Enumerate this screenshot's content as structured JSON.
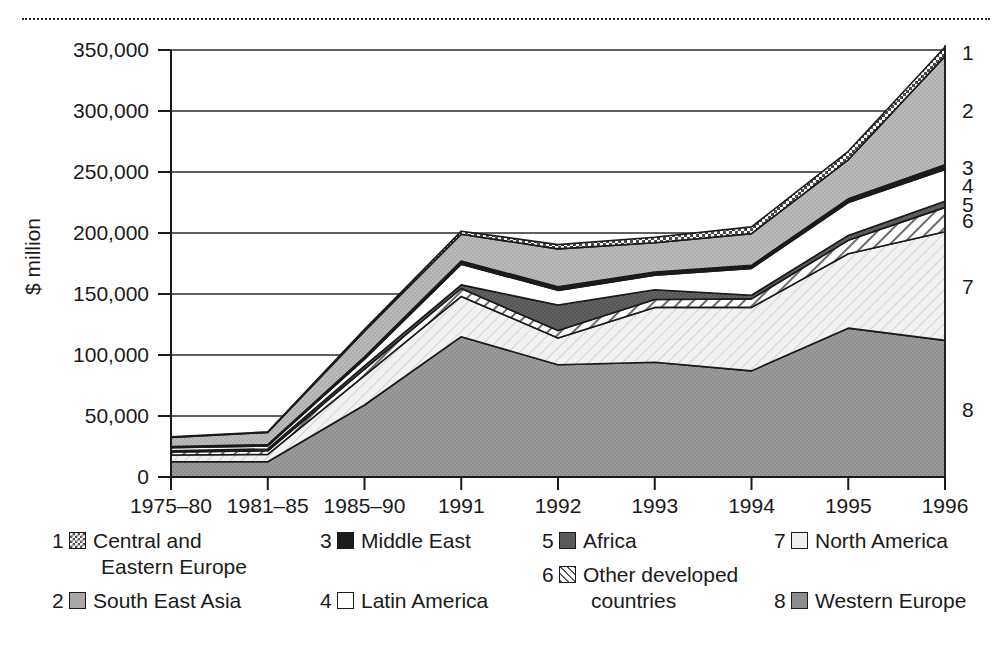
{
  "chart_data": {
    "type": "area",
    "stacked": true,
    "title": "",
    "xlabel": "",
    "ylabel": "$ million",
    "ylim": [
      0,
      350000
    ],
    "yticks": [
      0,
      50000,
      100000,
      150000,
      200000,
      250000,
      300000,
      350000
    ],
    "ytick_labels": [
      "0",
      "50,000",
      "100,000",
      "150,000",
      "200,000",
      "250,000",
      "300,000",
      "350,000"
    ],
    "grid": true,
    "legend_position": "below",
    "categories": [
      "1975-80",
      "1981-85",
      "1985-90",
      "1991",
      "1992",
      "1993",
      "1994",
      "1995",
      "1996"
    ],
    "stack_order_bottom_to_top": [
      "Western Europe",
      "North America",
      "Other developed countries",
      "Africa",
      "Latin America",
      "Middle East",
      "South East Asia",
      "Central and Eastern Europe"
    ],
    "series": [
      {
        "name": "Central and Eastern Europe",
        "key": 1,
        "values": [
          400,
          500,
          1500,
          2500,
          3500,
          4500,
          5500,
          7000,
          7500
        ]
      },
      {
        "name": "South East Asia",
        "key": 2,
        "values": [
          7500,
          10000,
          21000,
          22000,
          31000,
          24000,
          26000,
          32000,
          89000
        ]
      },
      {
        "name": "Middle East",
        "key": 3,
        "values": [
          1000,
          1000,
          2000,
          2500,
          3000,
          2500,
          2500,
          3000,
          4000
        ]
      },
      {
        "name": "Latin America",
        "key": 4,
        "values": [
          2500,
          2500,
          5500,
          17000,
          12000,
          12000,
          22000,
          27000,
          26000
        ]
      },
      {
        "name": "Africa",
        "key": 5,
        "values": [
          1000,
          1500,
          2500,
          3000,
          21000,
          8000,
          3000,
          4000,
          5000
        ]
      },
      {
        "name": "Other developed countries",
        "key": 6,
        "values": [
          2500,
          3000,
          5500,
          6500,
          6000,
          6500,
          7000,
          11000,
          20000
        ]
      },
      {
        "name": "North America",
        "key": 7,
        "values": [
          5500,
          6000,
          24000,
          33000,
          22000,
          45000,
          52000,
          61000,
          89000
        ]
      },
      {
        "name": "Western Europe",
        "key": 8,
        "values": [
          12500,
          12500,
          59000,
          115000,
          92000,
          94000,
          87000,
          122000,
          112000
        ]
      }
    ],
    "totals": [
      33000,
      37000,
      121000,
      201500,
      190500,
      196500,
      205000,
      267000,
      352500
    ],
    "right_axis_numbers": [
      "1",
      "2",
      "3",
      "4",
      "5",
      "6",
      "7",
      "8"
    ]
  },
  "axis": {
    "y_title": "$ million"
  },
  "legend": {
    "columns": [
      [
        {
          "num": "1",
          "label": "Central and\nEastern Europe",
          "swatch": "checker-pattern-swatch",
          "pattern": "sw-checker"
        },
        {
          "num": "2",
          "label": "South East Asia",
          "swatch": "mid-grey-swatch",
          "pattern": "sw-midgrey"
        }
      ],
      [
        {
          "num": "3",
          "label": "Middle East",
          "swatch": "black-swatch",
          "pattern": "sw-black"
        },
        {
          "num": "4",
          "label": "Latin America",
          "swatch": "white-swatch",
          "pattern": "sw-white"
        }
      ],
      [
        {
          "num": "5",
          "label": "Africa",
          "swatch": "dark-grey-swatch",
          "pattern": "sw-darkgrey"
        },
        {
          "num": "6",
          "label": "Other developed\ncountries",
          "swatch": "hatch-swatch",
          "pattern": "sw-hatch"
        }
      ],
      [
        {
          "num": "7",
          "label": "North America",
          "swatch": "very-light-swatch",
          "pattern": "sw-vlight"
        },
        {
          "num": "8",
          "label": "Western Europe",
          "swatch": "grey-swatch",
          "pattern": "sw-grey"
        }
      ]
    ]
  },
  "colors": {
    "central_eastern_europe": "#ffffff",
    "south_east_asia": "#a8a8a8",
    "middle_east": "#1c1c1c",
    "latin_america": "#ffffff",
    "africa": "#5a5a5a",
    "other_developed": "#ffffff",
    "north_america": "#efefef",
    "western_europe": "#8c8c8c",
    "axis": "#1a1a1a",
    "grid": "#2b2b2b"
  }
}
